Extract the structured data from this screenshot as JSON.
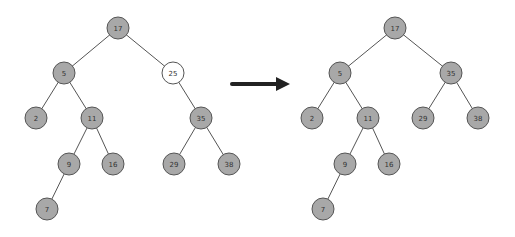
{
  "diagram": {
    "type": "binary-search-tree-deletion",
    "colors": {
      "node_fill": "#a8a8a8",
      "node_stroke": "#555555",
      "highlight_fill": "#ffffff",
      "edge": "#555555",
      "arrow": "#222222",
      "label": "#333333"
    },
    "node_radius": 11,
    "before_tree": {
      "nodes": [
        {
          "id": "b17",
          "label": "17",
          "x": 118,
          "y": 28,
          "highlight": false
        },
        {
          "id": "b5",
          "label": "5",
          "x": 64,
          "y": 73,
          "highlight": false
        },
        {
          "id": "b25",
          "label": "25",
          "x": 173,
          "y": 73,
          "highlight": true
        },
        {
          "id": "b2",
          "label": "2",
          "x": 36,
          "y": 118,
          "highlight": false
        },
        {
          "id": "b11",
          "label": "11",
          "x": 92,
          "y": 118,
          "highlight": false
        },
        {
          "id": "b35",
          "label": "35",
          "x": 201,
          "y": 118,
          "highlight": false
        },
        {
          "id": "b9",
          "label": "9",
          "x": 69,
          "y": 164,
          "highlight": false
        },
        {
          "id": "b16",
          "label": "16",
          "x": 113,
          "y": 164,
          "highlight": false
        },
        {
          "id": "b29",
          "label": "29",
          "x": 174,
          "y": 164,
          "highlight": false
        },
        {
          "id": "b38",
          "label": "38",
          "x": 229,
          "y": 164,
          "highlight": false
        },
        {
          "id": "b7",
          "label": "7",
          "x": 47,
          "y": 209,
          "highlight": false
        }
      ],
      "edges": [
        [
          "b17",
          "b5"
        ],
        [
          "b17",
          "b25"
        ],
        [
          "b5",
          "b2"
        ],
        [
          "b5",
          "b11"
        ],
        [
          "b25",
          "b35"
        ],
        [
          "b11",
          "b9"
        ],
        [
          "b11",
          "b16"
        ],
        [
          "b35",
          "b29"
        ],
        [
          "b35",
          "b38"
        ],
        [
          "b9",
          "b7"
        ]
      ]
    },
    "arrow": {
      "x1": 232,
      "y1": 84,
      "x2": 290,
      "y2": 84
    },
    "after_tree": {
      "nodes": [
        {
          "id": "a17",
          "label": "17",
          "x": 395,
          "y": 28,
          "highlight": false
        },
        {
          "id": "a5",
          "label": "5",
          "x": 340,
          "y": 73,
          "highlight": false
        },
        {
          "id": "a35",
          "label": "35",
          "x": 451,
          "y": 73,
          "highlight": false
        },
        {
          "id": "a2",
          "label": "2",
          "x": 312,
          "y": 118,
          "highlight": false
        },
        {
          "id": "a11",
          "label": "11",
          "x": 368,
          "y": 118,
          "highlight": false
        },
        {
          "id": "a29",
          "label": "29",
          "x": 423,
          "y": 118,
          "highlight": false
        },
        {
          "id": "a38",
          "label": "38",
          "x": 478,
          "y": 118,
          "highlight": false
        },
        {
          "id": "a9",
          "label": "9",
          "x": 345,
          "y": 164,
          "highlight": false
        },
        {
          "id": "a16",
          "label": "16",
          "x": 389,
          "y": 164,
          "highlight": false
        },
        {
          "id": "a7",
          "label": "7",
          "x": 323,
          "y": 209,
          "highlight": false
        }
      ],
      "edges": [
        [
          "a17",
          "a5"
        ],
        [
          "a17",
          "a35"
        ],
        [
          "a5",
          "a2"
        ],
        [
          "a5",
          "a11"
        ],
        [
          "a35",
          "a29"
        ],
        [
          "a35",
          "a38"
        ],
        [
          "a11",
          "a9"
        ],
        [
          "a11",
          "a16"
        ],
        [
          "a9",
          "a7"
        ]
      ]
    }
  }
}
